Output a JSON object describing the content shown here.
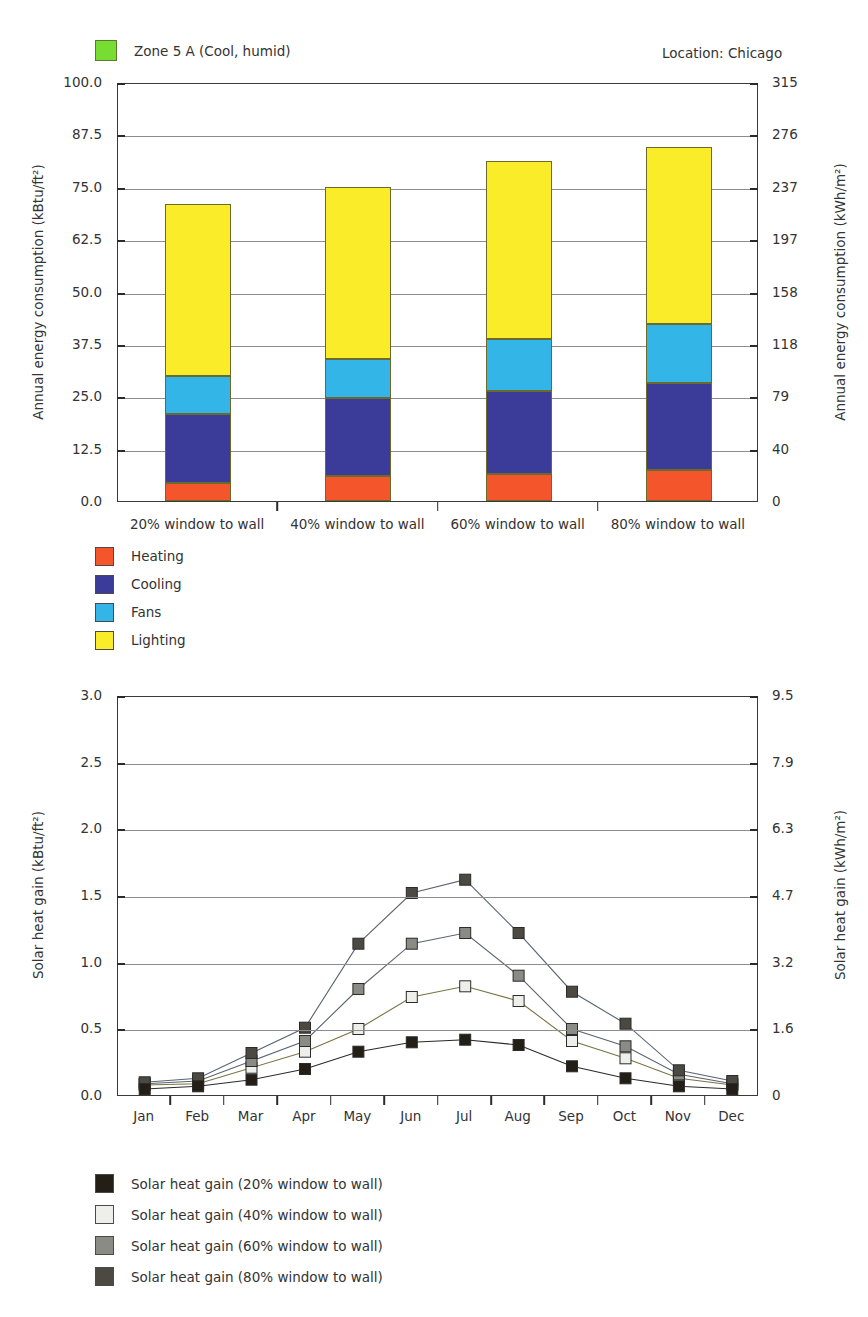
{
  "header": {
    "zone_label": "Zone 5 A (Cool, humid)",
    "zone_color": "#77dd33",
    "location_label": "Location:  Chicago"
  },
  "chart_data": [
    {
      "type": "bar",
      "stacked": true,
      "title": "",
      "categories": [
        "20% window to wall",
        "40% window to wall",
        "60% window to wall",
        "80% window to wall"
      ],
      "series": [
        {
          "name": "Heating",
          "color": "#f4552b",
          "values": [
            4.2,
            6.0,
            6.4,
            7.4
          ]
        },
        {
          "name": "Cooling",
          "color": "#3b3b99",
          "values": [
            16.6,
            18.6,
            19.9,
            20.8
          ]
        },
        {
          "name": "Fans",
          "color": "#33b5e8",
          "values": [
            9.1,
            9.3,
            12.4,
            14.0
          ]
        },
        {
          "name": "Lighting",
          "color": "#faec28",
          "values": [
            41.1,
            41.1,
            42.4,
            42.2
          ]
        }
      ],
      "totals": [
        71.0,
        75.0,
        81.1,
        84.4
      ],
      "ylabel": "Annual energy consumption (kBtu/ft²)",
      "ylabel_right": "Annual energy consumption (kWh/m²)",
      "xlabel": "",
      "ylim": [
        0,
        100
      ],
      "yticks": [
        "0.0",
        "12.5",
        "25.0",
        "37.5",
        "50.0",
        "62.5",
        "75.0",
        "87.5",
        "100.0"
      ],
      "yticks_right": [
        "0",
        "40",
        "79",
        "118",
        "158",
        "197",
        "237",
        "276",
        "315"
      ],
      "grid": true,
      "legend_position": "below-left",
      "legend": [
        "Heating",
        "Cooling",
        "Fans",
        "Lighting"
      ]
    },
    {
      "type": "line",
      "title": "",
      "x": [
        "Jan",
        "Feb",
        "Mar",
        "Apr",
        "May",
        "Jun",
        "Jul",
        "Aug",
        "Sep",
        "Oct",
        "Nov",
        "Dec"
      ],
      "series": [
        {
          "name": "Solar heat gain (20% window to wall)",
          "color": "#231f17",
          "values": [
            0.06,
            0.08,
            0.13,
            0.21,
            0.34,
            0.41,
            0.43,
            0.39,
            0.23,
            0.14,
            0.08,
            0.06
          ]
        },
        {
          "name": "Solar heat gain (40% window to wall)",
          "color": "#eeeeea",
          "values": [
            0.09,
            0.1,
            0.22,
            0.34,
            0.51,
            0.75,
            0.83,
            0.72,
            0.42,
            0.29,
            0.14,
            0.09
          ]
        },
        {
          "name": "Solar heat gain (60% window to wall)",
          "color": "#8b8b86",
          "values": [
            0.1,
            0.12,
            0.27,
            0.42,
            0.81,
            1.15,
            1.23,
            0.91,
            0.51,
            0.38,
            0.17,
            0.1
          ]
        },
        {
          "name": "Solar heat gain (80% window to wall)",
          "color": "#4b4942",
          "values": [
            0.11,
            0.14,
            0.33,
            0.52,
            1.15,
            1.53,
            1.63,
            1.23,
            0.79,
            0.55,
            0.2,
            0.12
          ]
        }
      ],
      "ylabel": "Solar heat gain (kBtu/ft²)",
      "ylabel_right": "Solar heat gain (kWh/m²)",
      "xlabel": "",
      "ylim": [
        0,
        3.0
      ],
      "yticks": [
        "0.0",
        "0.5",
        "1.0",
        "1.5",
        "2.0",
        "2.5",
        "3.0"
      ],
      "yticks_right": [
        "0",
        "1.6",
        "3.2",
        "4.7",
        "6.3",
        "7.9",
        "9.5"
      ],
      "grid": true,
      "legend_position": "below-left",
      "legend": [
        "Solar heat gain (20% window to wall)",
        "Solar heat gain (40% window to wall)",
        "Solar heat gain (60% window to wall)",
        "Solar heat gain (80% window to wall)"
      ]
    }
  ]
}
